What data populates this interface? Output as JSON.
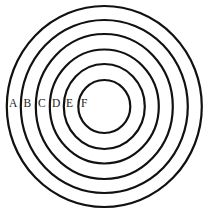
{
  "diagram": {
    "type": "concentric-circles",
    "center": {
      "cx": 104.3,
      "cy": 106.5
    },
    "stroke_color": "#111111",
    "label_color": "#222222",
    "background": "#ffffff",
    "rings": [
      {
        "label": "A",
        "rx": 97.5,
        "ry": 100.5,
        "label_x": 9,
        "label_y": 107
      },
      {
        "label": "B",
        "rx": 83.5,
        "ry": 86.5,
        "label_x": 23.5,
        "label_y": 107
      },
      {
        "label": "C",
        "rx": 68.5,
        "ry": 72.5,
        "label_x": 38,
        "label_y": 107
      },
      {
        "label": "D",
        "rx": 54.5,
        "ry": 57,
        "label_x": 52,
        "label_y": 107
      },
      {
        "label": "E",
        "rx": 40.5,
        "ry": 42.5,
        "label_x": 66,
        "label_y": 107
      },
      {
        "label": "F",
        "rx": 26,
        "ry": 26.5,
        "label_x": 81,
        "label_y": 107
      }
    ]
  }
}
